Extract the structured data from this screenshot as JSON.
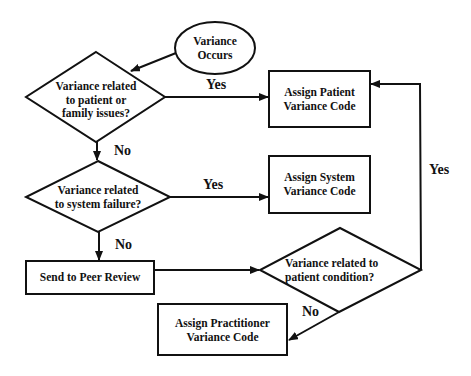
{
  "diagram": {
    "type": "flowchart",
    "nodes": {
      "start": {
        "shape": "ellipse",
        "line1": "Variance",
        "line2": "Occurs"
      },
      "q_patient_family": {
        "shape": "diamond",
        "line1": "Variance related",
        "line2": "to patient or",
        "line3": "family issues?"
      },
      "assign_patient": {
        "shape": "rect",
        "line1": "Assign Patient",
        "line2": "Variance Code"
      },
      "q_system": {
        "shape": "diamond",
        "line1": "Variance related",
        "line2": "to system failure?"
      },
      "assign_system": {
        "shape": "rect",
        "line1": "Assign System",
        "line2": "Variance Code"
      },
      "peer_review": {
        "shape": "rect",
        "line1": "Send to Peer Review"
      },
      "q_patient_condition": {
        "shape": "diamond",
        "line1": "Variance related to",
        "line2": "patient condition?"
      },
      "assign_practitioner": {
        "shape": "rect",
        "line1": "Assign Practitioner",
        "line2": "Variance Code"
      }
    },
    "edges": {
      "e1": {
        "from": "start",
        "to": "q_patient_family",
        "label": ""
      },
      "e2": {
        "from": "q_patient_family",
        "to": "assign_patient",
        "label": "Yes"
      },
      "e3": {
        "from": "q_patient_family",
        "to": "q_system",
        "label": "No"
      },
      "e4": {
        "from": "q_system",
        "to": "assign_system",
        "label": "Yes"
      },
      "e5": {
        "from": "q_system",
        "to": "peer_review",
        "label": "No"
      },
      "e6": {
        "from": "peer_review",
        "to": "q_patient_condition",
        "label": ""
      },
      "e7": {
        "from": "q_patient_condition",
        "to": "assign_patient",
        "label": "Yes"
      },
      "e8": {
        "from": "q_patient_condition",
        "to": "assign_practitioner",
        "label": "No"
      }
    },
    "colors": {
      "stroke": "#111111",
      "fill": "#ffffff",
      "text": "#111111"
    }
  }
}
